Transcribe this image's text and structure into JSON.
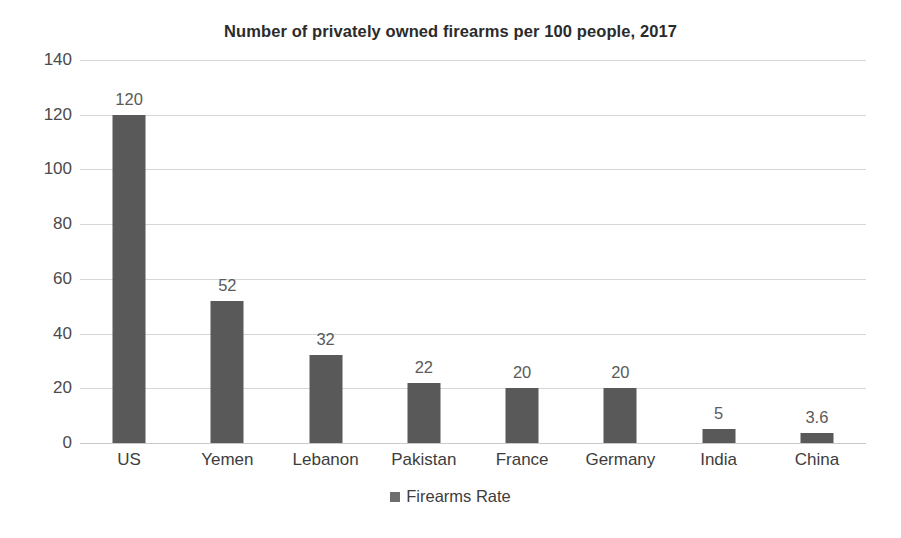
{
  "chart_data": {
    "type": "bar",
    "title": "Number of privately owned firearms per 100 people, 2017",
    "xlabel": "",
    "ylabel": "",
    "categories": [
      "US",
      "Yemen",
      "Lebanon",
      "Pakistan",
      "France",
      "Germany",
      "India",
      "China"
    ],
    "values": [
      120,
      52,
      32,
      22,
      20,
      20,
      5,
      3.6
    ],
    "value_labels": [
      "120",
      "52",
      "32",
      "22",
      "20",
      "20",
      "5",
      "3.6"
    ],
    "series": [
      {
        "name": "Firearms Rate",
        "values": [
          120,
          52,
          32,
          22,
          20,
          20,
          5,
          3.6
        ],
        "color": "#595959"
      }
    ],
    "ylim": [
      0,
      140
    ],
    "ytick_values": [
      0,
      20,
      40,
      60,
      80,
      100,
      120,
      140
    ],
    "ytick_labels": [
      "0",
      "20",
      "40",
      "60",
      "80",
      "100",
      "120",
      "140"
    ],
    "grid": true,
    "grid_color": "#d6d6d6",
    "legend": {
      "position": "bottom",
      "entries": [
        {
          "label": "Firearms Rate",
          "marker": "square-marker",
          "color": "#6e6e6e"
        }
      ]
    },
    "background_color": "#ffffff",
    "title_color": "#2b2b2b",
    "label_color": "#5a5a5a",
    "data_labels_shown": true
  }
}
